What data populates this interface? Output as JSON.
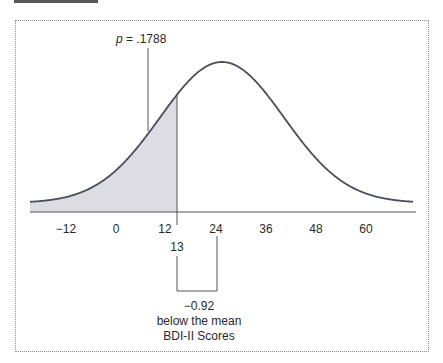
{
  "chart_data": {
    "type": "area",
    "title": "",
    "xlabel": "BDI-II Scores",
    "ylabel": "",
    "distribution": "normal",
    "mean": 24,
    "x_ticks": [
      -12,
      0,
      12,
      24,
      36,
      48,
      60
    ],
    "x_tick_labels": [
      "−12",
      "0",
      "12",
      "24",
      "36",
      "48",
      "60"
    ],
    "xlim": [
      -21,
      75
    ],
    "shaded_region": {
      "from": "-inf",
      "to": 13,
      "color": "#dcdce2"
    },
    "marker_value": 13,
    "marker_label": "13",
    "annotations": {
      "p_value_label": "p = .1788",
      "z_label": "−0.92",
      "z_caption": "below the mean",
      "axis_caption": "BDI-II Scores"
    },
    "grid": false,
    "legend": "none",
    "colors": {
      "curve": "#4a4e5c",
      "shade": "#dcdce2",
      "axis": "#555555",
      "frame": "#8a8a8a"
    }
  },
  "labels": {
    "p_value": "p = .1788",
    "marker": "13",
    "z_value": "−0.92",
    "z_caption": "below the mean",
    "axis_title": "BDI-II Scores",
    "ticks": [
      "−12",
      "0",
      "12",
      "24",
      "36",
      "48",
      "60"
    ]
  }
}
